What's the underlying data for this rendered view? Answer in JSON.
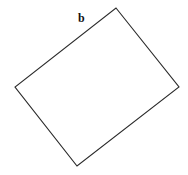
{
  "diagram": {
    "type": "rotated-rectangle",
    "label": "b",
    "label_position": {
      "x": 78,
      "y": 12
    },
    "vertices": [
      {
        "name": "top",
        "x": 116,
        "y": 8
      },
      {
        "name": "right",
        "x": 179,
        "y": 87
      },
      {
        "name": "bottom",
        "x": 77,
        "y": 166
      },
      {
        "name": "left",
        "x": 15,
        "y": 87
      }
    ],
    "stroke_color": "#2a2a2a",
    "background_color": "#ffffff"
  }
}
